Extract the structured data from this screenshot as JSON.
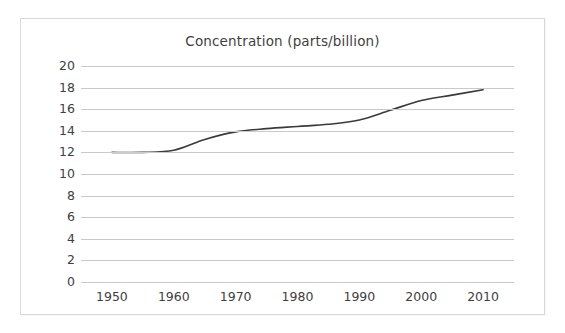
{
  "chart_data": {
    "type": "line",
    "title": "Concentration (parts/billion)",
    "xlabel": "",
    "ylabel": "",
    "xlim": [
      1945,
      2015
    ],
    "ylim": [
      0,
      20
    ],
    "ytick_step": 2,
    "xtick_step": 10,
    "grid": "horizontal",
    "legend": "none",
    "line_color": "#3a3a3a",
    "grid_color": "#c9c9c9",
    "text_color": "#404040",
    "yticks": [
      0,
      2,
      4,
      6,
      8,
      10,
      12,
      14,
      16,
      18,
      20
    ],
    "xticks": [
      1950,
      1960,
      1970,
      1980,
      1990,
      2000,
      2010
    ],
    "ytick_labels": [
      "0",
      "2",
      "4",
      "6",
      "8",
      "10",
      "12",
      "14",
      "16",
      "18",
      "20"
    ],
    "xtick_labels": [
      "1950",
      "1960",
      "1970",
      "1980",
      "1990",
      "2000",
      "2010"
    ],
    "series": [
      {
        "name": "Concentration",
        "x": [
          1950,
          1955,
          1960,
          1965,
          1970,
          1975,
          1980,
          1985,
          1990,
          1995,
          2000,
          2005,
          2010
        ],
        "values": [
          12.0,
          12.0,
          12.2,
          13.2,
          13.9,
          14.2,
          14.4,
          14.6,
          15.0,
          15.9,
          16.8,
          17.3,
          17.8
        ]
      }
    ]
  }
}
